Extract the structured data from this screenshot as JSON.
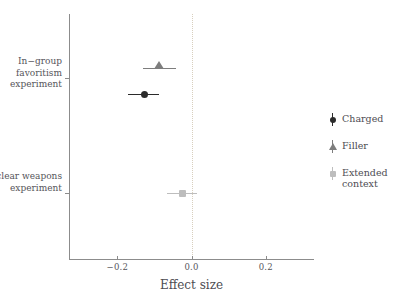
{
  "chart_data": {
    "type": "scatter",
    "title": "",
    "subtitle": "",
    "xlabel": "Effect size",
    "ylabel": "",
    "xlim": [
      -0.33,
      0.33
    ],
    "ylim_categories": [
      "In-group favoritism experiment",
      "Nuclear weapons experiment"
    ],
    "x_ticks": [
      {
        "value": -0.2,
        "label": "−0.2"
      },
      {
        "value": 0.0,
        "label": "0.0"
      },
      {
        "value": 0.2,
        "label": "0.2"
      }
    ],
    "y_ticks": [
      {
        "label": "In−group\nfavoritism\nexperiment"
      },
      {
        "label": "Nuclear\nweapons\nexperiment"
      }
    ],
    "grid": false,
    "reference_line": {
      "value": 0.0,
      "style": "dotted",
      "color": "#d8cfbe"
    },
    "legend_position": "right",
    "series": [
      {
        "name": "Charged",
        "marker": "circle",
        "color": "#2b2b2b",
        "points": [
          {
            "category": "In-group favoritism experiment",
            "estimate": -0.128,
            "ci_low": -0.17,
            "ci_high": -0.087
          }
        ]
      },
      {
        "name": "Filler",
        "marker": "triangle",
        "color": "#7d7d7d",
        "points": [
          {
            "category": "In-group favoritism experiment",
            "estimate": -0.087,
            "ci_low": -0.132,
            "ci_high": -0.043
          }
        ]
      },
      {
        "name": "Extended context",
        "marker": "square",
        "color": "#bdbdbd",
        "points": [
          {
            "category": "Nuclear weapons experiment",
            "estimate": -0.024,
            "ci_low": -0.065,
            "ci_high": 0.014
          }
        ]
      }
    ]
  },
  "legend": {
    "entries": [
      {
        "label": "Charged"
      },
      {
        "label": "Filler"
      },
      {
        "label": "Extended\ncontext"
      }
    ]
  },
  "axis": {
    "x_title": "Effect size",
    "axis_color": "#8c8c8c"
  }
}
